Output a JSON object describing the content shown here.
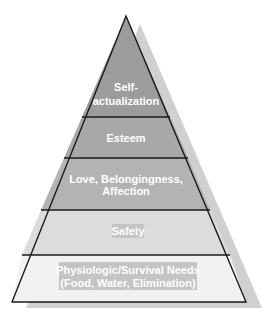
{
  "diagram": {
    "type": "pyramid",
    "title": "",
    "colors": {
      "outline": "#1a1a1a",
      "shadow": "#cfcfcf",
      "label_text": "#ffffff",
      "label_highlight": "#c4c4c4"
    },
    "levels": [
      {
        "id": "self-actualization",
        "lines": [
          "Self-",
          "actualization"
        ],
        "fill": "#9c9c9c"
      },
      {
        "id": "esteem",
        "lines": [
          "Esteem"
        ],
        "fill": "#a8a8a8"
      },
      {
        "id": "love-belongingness",
        "lines": [
          "Love, Belongingness,",
          "Affection"
        ],
        "fill": "#b3b3b3"
      },
      {
        "id": "safety",
        "lines": [
          "Safety"
        ],
        "fill": "#dcdcdc"
      },
      {
        "id": "physiologic",
        "lines": [
          "Physiologic/Survival Needs",
          "(Food, Water, Elimination)"
        ],
        "fill": "#f1f1f1"
      }
    ]
  }
}
